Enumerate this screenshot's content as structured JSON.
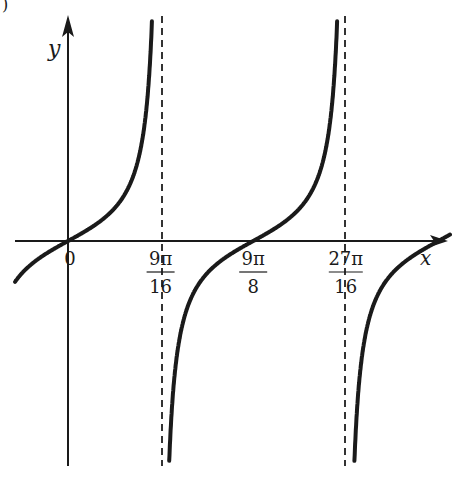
{
  "part_label": ")",
  "chart_data": {
    "type": "line",
    "title": "",
    "function": "y = tan(8x/9)",
    "xlabel": "x",
    "ylabel": "y",
    "period": "9π/8",
    "x_ticks": [
      {
        "value": 0,
        "label": "0",
        "num": "",
        "den": ""
      },
      {
        "value": 1.7671,
        "label": "9π/16",
        "num": "9π",
        "den": "16"
      },
      {
        "value": 3.5343,
        "label": "9π/8",
        "num": "9π",
        "den": "8"
      },
      {
        "value": 5.3014,
        "label": "27π/16",
        "num": "27π",
        "den": "16"
      }
    ],
    "asymptotes": [
      {
        "x": 1.7671,
        "label": "9π/16"
      },
      {
        "x": 5.3014,
        "label": "27π/16"
      }
    ],
    "zeros": [
      0,
      3.5343,
      7.0686
    ],
    "grid": false,
    "legend": "none",
    "colors": {
      "curve": "#1a1a1a",
      "axis": "#1a1a1a",
      "asymptote": "#333333"
    }
  },
  "layout": {
    "origin_px": [
      68,
      241
    ],
    "px_per_unit_x": 52.4,
    "px_per_unit_y": 52.4,
    "x_axis_px": [
      15,
      448
    ],
    "y_axis_px": [
      15,
      466
    ],
    "asymptote_px": [
      162,
      345
    ],
    "curve_clip_y": [
      16,
      466
    ]
  }
}
